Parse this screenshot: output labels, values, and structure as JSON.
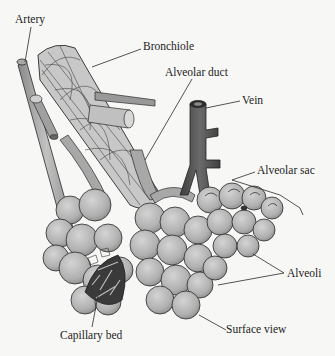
{
  "diagram": {
    "labels": {
      "artery": "Artery",
      "bronchiole": "Bronchiole",
      "alveolar_duct": "Alveolar duct",
      "vein": "Vein",
      "alveolar_sac": "Alveolar sac",
      "alveoli": "Alveoli",
      "capillary_bed": "Capillary bed",
      "surface_view": "Surface view"
    },
    "colors": {
      "background": "#f7f7f5",
      "alveoli_fill": "#b9b9b9",
      "vessel_fill": "#9a9a9a",
      "vein_fill": "#555555",
      "capillary_fill": "#3a3a3a",
      "line": "#2a2a2a"
    }
  }
}
